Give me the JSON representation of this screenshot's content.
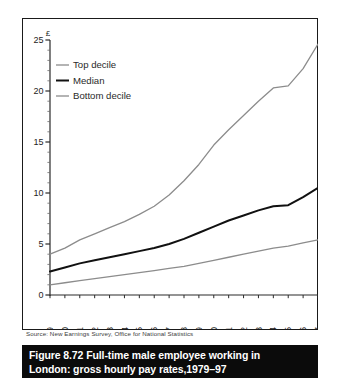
{
  "figure": {
    "caption_number": "Figure 8.72",
    "caption_line1": "Full-time male employee working in",
    "caption_line2": "London: gross hourly pay rates,1979–97",
    "source": "Source: New Earnings Survey, Office for National Statistics"
  },
  "colors": {
    "top_decile": "#8c8c8c",
    "median": "#111111",
    "bottom_decile": "#8c8c8c",
    "axis": "#2b2b2b",
    "caption_bar": "#0b0b0b",
    "caption_text": "#ffffff",
    "plot_background": "#ffffff",
    "source_text": "#3b3b3b"
  },
  "chart_data": {
    "type": "line",
    "title": "",
    "xlabel": "",
    "ylabel": "£",
    "ylim": [
      0,
      25
    ],
    "yticks": [
      0,
      5,
      10,
      15,
      20,
      25
    ],
    "ytick_labels": [
      "0",
      "5",
      "10",
      "15",
      "20",
      "25"
    ],
    "minor_ytick_step": 1,
    "grid": false,
    "legend_position": "top-left",
    "x": [
      "1979",
      "1980",
      "1981",
      "1982",
      "1983",
      "1984",
      "1985",
      "1986",
      "1987",
      "1988",
      "1989",
      "1990",
      "1991",
      "1992",
      "1993",
      "1994",
      "1995",
      "1996",
      "1997"
    ],
    "categories": [
      "1979",
      "1980",
      "1981",
      "1982",
      "1983",
      "1984",
      "1985",
      "1986",
      "1987",
      "1988",
      "1989",
      "1990",
      "1991",
      "1992",
      "1993",
      "1994",
      "1995",
      "1996",
      "1997"
    ],
    "series": [
      {
        "name": "Top decile",
        "color": "#8c8c8c",
        "width": 1.3,
        "values": [
          4.0,
          4.6,
          5.4,
          6.0,
          6.6,
          7.2,
          7.9,
          8.7,
          9.8,
          11.2,
          12.8,
          14.7,
          16.2,
          17.6,
          19.0,
          20.3,
          20.5,
          22.2,
          24.6
        ]
      },
      {
        "name": "Median",
        "color": "#111111",
        "width": 2.0,
        "values": [
          2.3,
          2.7,
          3.1,
          3.4,
          3.7,
          4.0,
          4.3,
          4.6,
          5.0,
          5.5,
          6.1,
          6.7,
          7.3,
          7.8,
          8.3,
          8.7,
          8.8,
          9.6,
          10.5
        ]
      },
      {
        "name": "Bottom decile",
        "color": "#8c8c8c",
        "width": 1.3,
        "values": [
          1.0,
          1.2,
          1.4,
          1.6,
          1.8,
          2.0,
          2.2,
          2.4,
          2.6,
          2.8,
          3.1,
          3.4,
          3.7,
          4.0,
          4.3,
          4.6,
          4.8,
          5.1,
          5.4
        ]
      }
    ],
    "legend": [
      {
        "label": "Top decile",
        "color": "#8c8c8c",
        "width": 1.3
      },
      {
        "label": "Median",
        "color": "#111111",
        "width": 2.0
      },
      {
        "label": "Bottom decile",
        "color": "#8c8c8c",
        "width": 1.3
      }
    ]
  }
}
